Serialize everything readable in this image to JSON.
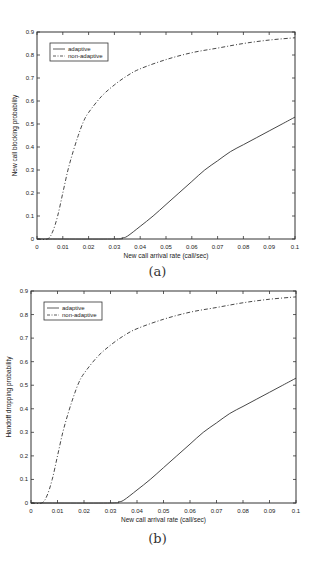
{
  "figures": [
    {
      "caption": "(a)"
    },
    {
      "caption": "(b)"
    }
  ],
  "chart_data": [
    {
      "type": "line",
      "title": "",
      "caption": "(a)",
      "xlabel": "New call arrival rate (call/sec)",
      "ylabel": "New call blocking probability",
      "xlim": [
        0,
        0.1
      ],
      "ylim": [
        0,
        0.9
      ],
      "xticks": [
        "0",
        "0.01",
        "0.02",
        "0.03",
        "0.04",
        "0.05",
        "0.06",
        "0.07",
        "0.08",
        "0.09",
        "0.1"
      ],
      "yticks": [
        "0",
        "0.1",
        "0.2",
        "0.3",
        "0.4",
        "0.5",
        "0.6",
        "0.7",
        "0.8",
        "0.9"
      ],
      "grid": false,
      "legend_position": "upper-left",
      "series": [
        {
          "name": "adaptive",
          "style": "solid",
          "x": [
            0,
            0.03,
            0.033,
            0.035,
            0.04,
            0.045,
            0.05,
            0.055,
            0.06,
            0.065,
            0.07,
            0.075,
            0.08,
            0.085,
            0.09,
            0.095,
            0.1
          ],
          "y": [
            0,
            0,
            0.005,
            0.012,
            0.055,
            0.1,
            0.15,
            0.2,
            0.25,
            0.3,
            0.34,
            0.38,
            0.41,
            0.44,
            0.47,
            0.5,
            0.53
          ]
        },
        {
          "name": "non-adaptive",
          "style": "dash-dot",
          "x": [
            0,
            0.004,
            0.006,
            0.008,
            0.01,
            0.012,
            0.014,
            0.016,
            0.018,
            0.02,
            0.025,
            0.03,
            0.035,
            0.04,
            0.05,
            0.06,
            0.07,
            0.08,
            0.09,
            0.1
          ],
          "y": [
            0,
            0,
            0.03,
            0.1,
            0.2,
            0.3,
            0.38,
            0.45,
            0.51,
            0.55,
            0.62,
            0.67,
            0.71,
            0.74,
            0.78,
            0.81,
            0.83,
            0.85,
            0.865,
            0.875
          ]
        }
      ]
    },
    {
      "type": "line",
      "title": "",
      "caption": "(b)",
      "xlabel": "New call arrival rate (call/sec)",
      "ylabel": "Handoff dropping probability",
      "xlim": [
        0,
        0.1
      ],
      "ylim": [
        0,
        0.9
      ],
      "xticks": [
        "0",
        "0.01",
        "0.02",
        "0.03",
        "0.04",
        "0.05",
        "0.06",
        "0.07",
        "0.08",
        "0.09",
        "0.1"
      ],
      "yticks": [
        "0",
        "0.1",
        "0.2",
        "0.3",
        "0.4",
        "0.5",
        "0.6",
        "0.7",
        "0.8",
        "0.9"
      ],
      "grid": false,
      "legend_position": "upper-left",
      "series": [
        {
          "name": "adaptive",
          "style": "solid",
          "x": [
            0,
            0.03,
            0.033,
            0.035,
            0.04,
            0.045,
            0.05,
            0.055,
            0.06,
            0.065,
            0.07,
            0.075,
            0.08,
            0.085,
            0.09,
            0.095,
            0.1
          ],
          "y": [
            0,
            0,
            0.005,
            0.012,
            0.055,
            0.1,
            0.15,
            0.2,
            0.25,
            0.3,
            0.34,
            0.38,
            0.41,
            0.44,
            0.47,
            0.5,
            0.53
          ]
        },
        {
          "name": "non-adaptive",
          "style": "dash-dot",
          "x": [
            0,
            0.004,
            0.006,
            0.008,
            0.01,
            0.012,
            0.014,
            0.016,
            0.018,
            0.02,
            0.025,
            0.03,
            0.035,
            0.04,
            0.05,
            0.06,
            0.07,
            0.08,
            0.09,
            0.1
          ],
          "y": [
            0,
            0,
            0.03,
            0.1,
            0.2,
            0.3,
            0.38,
            0.45,
            0.51,
            0.55,
            0.62,
            0.67,
            0.71,
            0.74,
            0.78,
            0.81,
            0.83,
            0.85,
            0.865,
            0.875
          ]
        }
      ]
    }
  ]
}
